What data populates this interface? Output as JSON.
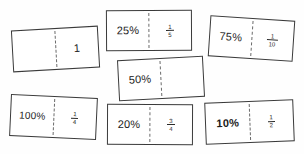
{
  "page": {
    "background_color": "#ffffff",
    "card_border_color": "#3a3a3a",
    "divider_color": "#6b6b6b",
    "text_color": "#1c1c1c"
  },
  "cards": [
    {
      "id": "card-1",
      "left_value": "",
      "right_value": "1",
      "right_type": "whole",
      "position": "top-left"
    },
    {
      "id": "card-25",
      "left_value": "25%",
      "right_numerator": "1",
      "right_denominator": "5",
      "right_type": "fraction",
      "position": "top-center"
    },
    {
      "id": "card-75",
      "left_value": "75%",
      "right_numerator": "1",
      "right_denominator": "10",
      "right_type": "fraction",
      "position": "top-right"
    },
    {
      "id": "card-50",
      "left_value": "50%",
      "right_value": "",
      "right_type": "empty",
      "position": "middle-center"
    },
    {
      "id": "card-100",
      "left_value": "100%",
      "right_numerator": "1",
      "right_denominator": "4",
      "right_type": "fraction",
      "position": "bottom-left"
    },
    {
      "id": "card-20",
      "left_value": "20%",
      "right_numerator": "3",
      "right_denominator": "4",
      "right_type": "fraction",
      "position": "bottom-center"
    },
    {
      "id": "card-10",
      "left_value": "10%",
      "left_bold": true,
      "right_numerator": "1",
      "right_denominator": "2",
      "right_type": "fraction",
      "position": "bottom-right"
    }
  ]
}
